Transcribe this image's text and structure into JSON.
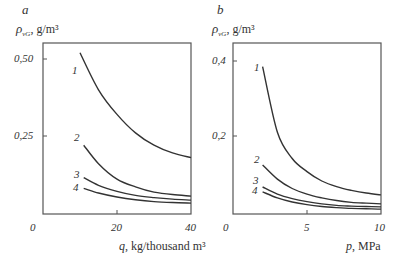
{
  "chart_data": [
    {
      "type": "line",
      "panel": "a",
      "title": "a",
      "ylabel": "ρ_vG, g/m³",
      "ylabel_parts": {
        "symbol": "ρ",
        "sub": "vG",
        "unit": ", g/m³"
      },
      "xlabel": "q, kg/thousand m³",
      "xlabel_parts": {
        "symbol": "q",
        "unit": ", kg/thousand m³"
      },
      "xlim": [
        0,
        40
      ],
      "ylim": [
        0,
        0.55
      ],
      "xticks": [
        "0",
        "20",
        "40"
      ],
      "yticks": [
        "0,25",
        "0,50"
      ],
      "grid": false,
      "series": [
        {
          "name": "1",
          "x": [
            10,
            15,
            20,
            25,
            30,
            35,
            40
          ],
          "values": [
            0.52,
            0.4,
            0.32,
            0.26,
            0.22,
            0.195,
            0.18
          ]
        },
        {
          "name": "2",
          "x": [
            11,
            15,
            20,
            25,
            30,
            35,
            40
          ],
          "values": [
            0.22,
            0.16,
            0.11,
            0.085,
            0.068,
            0.06,
            0.055
          ]
        },
        {
          "name": "3",
          "x": [
            11,
            15,
            20,
            25,
            30,
            35,
            40
          ],
          "values": [
            0.115,
            0.09,
            0.07,
            0.057,
            0.05,
            0.045,
            0.042
          ]
        },
        {
          "name": "4",
          "x": [
            11,
            15,
            20,
            25,
            30,
            35,
            40
          ],
          "values": [
            0.08,
            0.065,
            0.052,
            0.043,
            0.037,
            0.034,
            0.032
          ]
        }
      ]
    },
    {
      "type": "line",
      "panel": "b",
      "title": "b",
      "ylabel": "ρ_vG, g/m³",
      "ylabel_parts": {
        "symbol": "ρ",
        "sub": "vG",
        "unit": ", g/m³"
      },
      "xlabel": "p, MPa",
      "xlabel_parts": {
        "symbol": "p",
        "unit": ", MPa"
      },
      "xlim": [
        0,
        10
      ],
      "ylim": [
        0,
        0.44
      ],
      "xticks": [
        "0",
        "5",
        "10"
      ],
      "yticks": [
        "0,2",
        "0,4"
      ],
      "grid": false,
      "series": [
        {
          "name": "1",
          "x": [
            2,
            3,
            4,
            5,
            6,
            7,
            8,
            9,
            10
          ],
          "values": [
            0.385,
            0.21,
            0.14,
            0.105,
            0.08,
            0.065,
            0.055,
            0.048,
            0.043
          ]
        },
        {
          "name": "2",
          "x": [
            2,
            3,
            4,
            5,
            6,
            7,
            8,
            9,
            10
          ],
          "values": [
            0.123,
            0.085,
            0.06,
            0.045,
            0.035,
            0.028,
            0.023,
            0.021,
            0.019
          ]
        },
        {
          "name": "3",
          "x": [
            2,
            3,
            4,
            5,
            6,
            7,
            8,
            9,
            10
          ],
          "values": [
            0.064,
            0.045,
            0.033,
            0.025,
            0.019,
            0.015,
            0.013,
            0.012,
            0.011
          ]
        },
        {
          "name": "4",
          "x": [
            2,
            3,
            4,
            5,
            6,
            7,
            8,
            9,
            10
          ],
          "values": [
            0.051,
            0.035,
            0.024,
            0.017,
            0.012,
            0.009,
            0.007,
            0.006,
            0.005
          ]
        }
      ]
    }
  ],
  "panels": {
    "a": {
      "letter": "a",
      "rho": "ρ",
      "sub": "vG",
      "unit": ", g/m³",
      "x_sym": "q",
      "x_unit": ", kg/thousand m³",
      "xt0": "0",
      "xt1": "20",
      "xt2": "40",
      "yt1": "0,25",
      "yt2": "0,50"
    },
    "b": {
      "letter": "b",
      "rho": "ρ",
      "sub": "vG",
      "unit": ", g/m³",
      "x_sym": "p",
      "x_unit": ", MPa",
      "xt0": "0",
      "xt1": "5",
      "xt2": "10",
      "yt1": "0,2",
      "yt2": "0,4"
    }
  },
  "curve_labels": [
    "1",
    "2",
    "3",
    "4"
  ],
  "colors": {
    "axis": "#555555",
    "curve": "#333333"
  }
}
